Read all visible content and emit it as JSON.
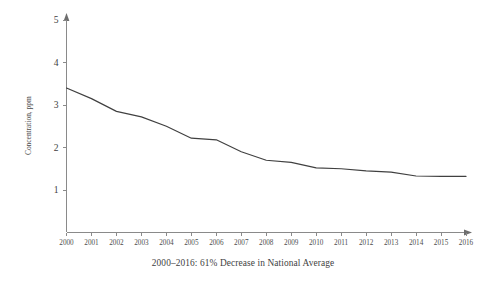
{
  "chart_data": {
    "type": "line",
    "title": "",
    "subtitle": "",
    "xlabel": "",
    "ylabel": "Concentration, ppm",
    "caption": "2000–2016:  61% Decrease in National Average",
    "grid": false,
    "legend": "none",
    "xlim": [
      2000,
      2016
    ],
    "ylim": [
      0,
      5
    ],
    "yticks": [
      1,
      2,
      3,
      4,
      5
    ],
    "ytick_labels": [
      "1",
      "2",
      "3",
      "4",
      "5"
    ],
    "xticks": [
      2000,
      2001,
      2002,
      2003,
      2004,
      2005,
      2006,
      2007,
      2008,
      2009,
      2010,
      2011,
      2012,
      2013,
      2014,
      2015,
      2016
    ],
    "xtick_labels": [
      "2000",
      "2001",
      "2002",
      "2003",
      "2004",
      "2005",
      "2006",
      "2007",
      "2008",
      "2009",
      "2010",
      "2011",
      "2012",
      "2013",
      "2014",
      "2015",
      "2016"
    ],
    "x": [
      2000,
      2001,
      2002,
      2003,
      2004,
      2005,
      2006,
      2007,
      2008,
      2009,
      2010,
      2011,
      2012,
      2013,
      2014,
      2015,
      2016
    ],
    "values": [
      3.4,
      3.15,
      2.85,
      2.72,
      2.5,
      2.22,
      2.18,
      1.9,
      1.7,
      1.65,
      1.52,
      1.5,
      1.45,
      1.42,
      1.33,
      1.32,
      1.32
    ],
    "series": [
      {
        "name": "National Average Concentration",
        "color": "#404040",
        "values": [
          3.4,
          3.15,
          2.85,
          2.72,
          2.5,
          2.22,
          2.18,
          1.9,
          1.7,
          1.65,
          1.52,
          1.5,
          1.45,
          1.42,
          1.33,
          1.32,
          1.32
        ]
      }
    ]
  },
  "colors": {
    "line": "#404040",
    "axis": "#8a8a8a",
    "text": "#3f3f3f",
    "background": "#ffffff"
  }
}
